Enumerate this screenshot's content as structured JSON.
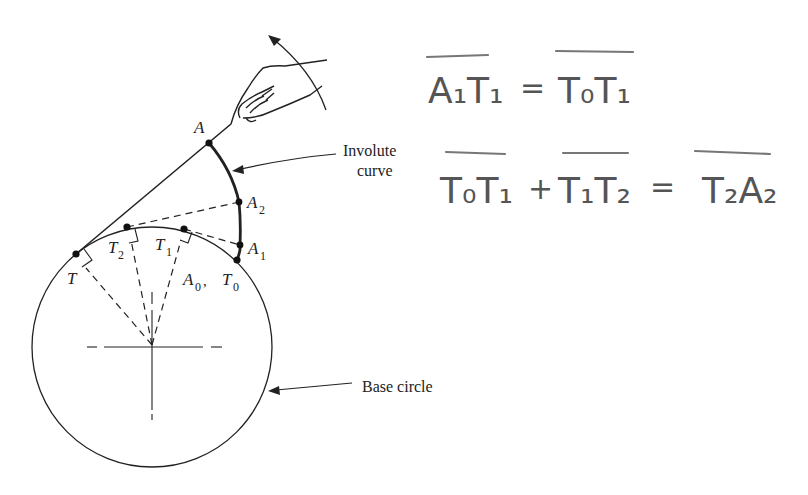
{
  "figure": {
    "labels": {
      "involute_curve_line1": "Involute",
      "involute_curve_line2": "curve",
      "base_circle": "Base circle"
    },
    "points": {
      "A": "A",
      "A2": "A",
      "A2_sub": "2",
      "A1": "A",
      "A1_sub": "1",
      "A0": "A",
      "A0_sub": "0",
      "T": "T",
      "T2": "T",
      "T2_sub": "2",
      "T1": "T",
      "T1_sub": "1",
      "T0": "T",
      "T0_sub": "0",
      "comma": ","
    },
    "colors": {
      "ink": "#222222",
      "pencil": "#777777",
      "background": "#ffffff"
    }
  },
  "annotations": {
    "equation1": {
      "lhs": "A₁T₁",
      "equals": "=",
      "rhs": "T₀T₁"
    },
    "equation2": {
      "term1": "T₀T₁",
      "plus1": "+",
      "term2": "T₁T₂",
      "equals": "=",
      "rhs": "T₂A₂"
    }
  }
}
